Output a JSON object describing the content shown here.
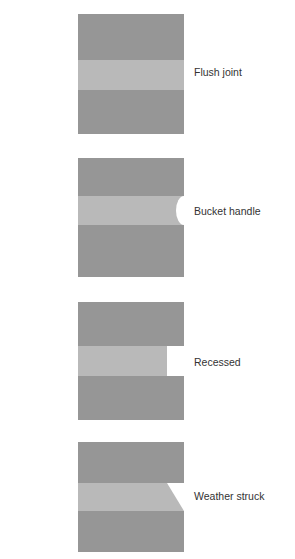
{
  "colors": {
    "brick": "#969696",
    "mortar": "#b9b9b9",
    "background": "#ffffff",
    "text": "#333333"
  },
  "joints": [
    {
      "id": "flush",
      "label": "Flush joint",
      "top": 14,
      "height": 120,
      "band_top": 46,
      "band_bottom": 76,
      "profile": "flush"
    },
    {
      "id": "bucket",
      "label": "Bucket handle",
      "top": 158,
      "height": 119,
      "band_top": 38,
      "band_bottom": 67,
      "profile": "bucket-handle"
    },
    {
      "id": "recessed",
      "label": "Recessed",
      "top": 302,
      "height": 118,
      "band_top": 44,
      "band_bottom": 74,
      "profile": "recessed"
    },
    {
      "id": "weather",
      "label": "Weather struck",
      "top": 442,
      "height": 110,
      "band_top": 41,
      "band_bottom": 69,
      "profile": "weather-struck"
    }
  ]
}
